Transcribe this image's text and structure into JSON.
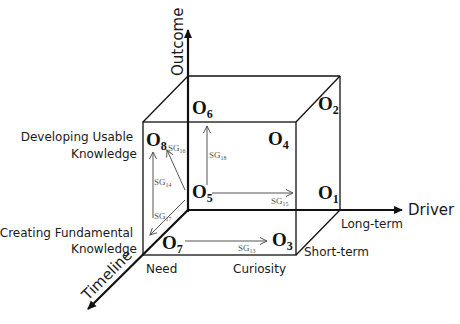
{
  "axes": {
    "outcome": "Outcome",
    "driver": "Driver",
    "timeline": "Timeline"
  },
  "outcome_levels": {
    "upper": [
      "Developing Usable",
      "Knowledge"
    ],
    "lower": [
      "Creating Fundamental",
      "Knowledge"
    ]
  },
  "driver_levels": {
    "need": "Need",
    "curiosity": "Curiosity"
  },
  "timeline_levels": {
    "long": "Long-term",
    "short": "Short-term"
  },
  "octants": {
    "o1": {
      "base": "O",
      "sub": "1"
    },
    "o2": {
      "base": "O",
      "sub": "2"
    },
    "o3": {
      "base": "O",
      "sub": "3"
    },
    "o4": {
      "base": "O",
      "sub": "4"
    },
    "o5": {
      "base": "O",
      "sub": "5"
    },
    "o6": {
      "base": "O",
      "sub": "6"
    },
    "o7": {
      "base": "O",
      "sub": "7"
    },
    "o8": {
      "base": "O",
      "sub": "8"
    }
  },
  "transitions": {
    "sg13": {
      "base": "SG",
      "sub": "13",
      "from": "O7",
      "to": "O3"
    },
    "sg14": {
      "base": "SG",
      "sub": "14",
      "from": "O7",
      "to": "O8"
    },
    "sg15": {
      "base": "SG",
      "sub": "15",
      "from": "O5",
      "to": "O1"
    },
    "sg16": {
      "base": "SG",
      "sub": "16",
      "from": "O5",
      "to": "O8"
    },
    "sg17": {
      "base": "SG",
      "sub": "17",
      "from": "O5",
      "to": "O7"
    },
    "sg18": {
      "base": "SG",
      "sub": "18",
      "from": "O5",
      "to": "O6"
    }
  },
  "colors": {
    "line": "#111111",
    "arrow_gray": "#555555"
  }
}
